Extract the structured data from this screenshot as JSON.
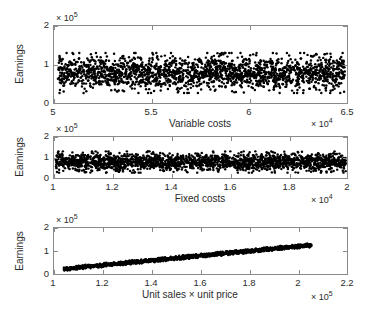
{
  "figure": {
    "width": 370,
    "height": 309,
    "background": "#ffffff",
    "marker_color": "#000000",
    "axis_color": "#8a8a8a",
    "text_color": "#2b2b2b"
  },
  "chart_data": [
    {
      "type": "scatter",
      "title": "",
      "xlabel": "Variable costs",
      "ylabel": "Earnings",
      "xlim": [
        50000,
        65000
      ],
      "ylim": [
        0,
        200000
      ],
      "x_exponent_label": "× 10",
      "x_exponent_power": "4",
      "y_exponent_label": "× 10",
      "y_exponent_power": "5",
      "xticks": [
        50000,
        55000,
        60000,
        65000
      ],
      "xticklabels": [
        "5",
        "5.5",
        "6",
        "6.5"
      ],
      "yticks": [
        0,
        100000,
        200000
      ],
      "yticklabels": [
        "0",
        "1",
        "2"
      ],
      "grid": false,
      "legend": "none",
      "n_points": 2000,
      "band": {
        "y_mean": 78000,
        "y_spread": 52000,
        "shape": "uniform-horizontal-band"
      },
      "x": [
        50000,
        65000
      ],
      "y": [
        25000,
        133000
      ]
    },
    {
      "type": "scatter",
      "title": "",
      "xlabel": "Fixed costs",
      "ylabel": "Earnings",
      "xlim": [
        10000,
        20000
      ],
      "ylim": [
        0,
        200000
      ],
      "x_exponent_label": "× 10",
      "x_exponent_power": "4",
      "y_exponent_label": "× 10",
      "y_exponent_power": "5",
      "xticks": [
        10000,
        12000,
        14000,
        16000,
        18000,
        20000
      ],
      "xticklabels": [
        "1",
        "1.2",
        "1.4",
        "1.6",
        "1.8",
        "2"
      ],
      "yticks": [
        0,
        100000,
        200000
      ],
      "yticklabels": [
        "0",
        "1",
        "2"
      ],
      "grid": false,
      "legend": "none",
      "n_points": 2000,
      "band": {
        "y_mean": 78000,
        "y_spread": 52000,
        "shape": "uniform-horizontal-band"
      },
      "x": [
        10000,
        20000
      ],
      "y": [
        25000,
        133000
      ]
    },
    {
      "type": "scatter",
      "title": "",
      "xlabel": "Unit sales × unit price",
      "ylabel": "Earnings",
      "xlim": [
        100000,
        220000
      ],
      "ylim": [
        0,
        200000
      ],
      "x_exponent_label": "× 10",
      "x_exponent_power": "5",
      "y_exponent_label": "× 10",
      "y_exponent_power": "5",
      "xticks": [
        100000,
        120000,
        140000,
        160000,
        180000,
        200000,
        220000
      ],
      "xticklabels": [
        "1",
        "1.2",
        "1.4",
        "1.6",
        "1.8",
        "2",
        "2.2"
      ],
      "yticks": [
        0,
        100000,
        200000
      ],
      "yticklabels": [
        "0",
        "1",
        "2"
      ],
      "grid": false,
      "legend": "none",
      "n_points": 2000,
      "band": {
        "slope": 1.02,
        "intercept": -84000,
        "x_min": 104000,
        "x_max": 205500,
        "y_at_xmin": 22000,
        "y_at_xmax": 126000,
        "thickness": 9000,
        "shape": "tight-linear-band"
      },
      "x": [
        104000,
        205500
      ],
      "y": [
        22000,
        126000
      ]
    }
  ]
}
